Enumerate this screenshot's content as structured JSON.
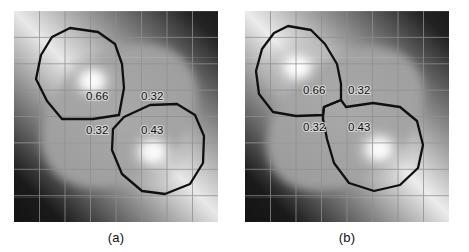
{
  "figure": {
    "panels": [
      {
        "id": "a",
        "caption": "(a)",
        "labels": [
          {
            "text": "0.66",
            "x": 72,
            "y": 89
          },
          {
            "text": "0.32",
            "x": 127,
            "y": 89
          },
          {
            "text": "0.32",
            "x": 72,
            "y": 123
          },
          {
            "text": "0.43",
            "x": 127,
            "y": 123
          }
        ]
      },
      {
        "id": "b",
        "caption": "(b)",
        "labels": [
          {
            "text": "0.66",
            "x": 58,
            "y": 83
          },
          {
            "text": "0.32",
            "x": 103,
            "y": 83
          },
          {
            "text": "0.32",
            "x": 58,
            "y": 120
          },
          {
            "text": "0.43",
            "x": 103,
            "y": 120
          }
        ]
      }
    ],
    "grid": {
      "columns": 8,
      "rows": 8,
      "cell_width": 25.5,
      "cell_height": 26.4,
      "line_color": "#8c8c8c"
    },
    "contour": {
      "color": "#101010",
      "width": 2.2
    },
    "image": {
      "background": "#0a0a0a",
      "band_color": "#f2f2f2",
      "blob_color": "#ffffff",
      "mid_color": "#9a9a9a",
      "blob_a_center": [
        78,
        70
      ],
      "blob_b_center": [
        138,
        140
      ]
    }
  }
}
